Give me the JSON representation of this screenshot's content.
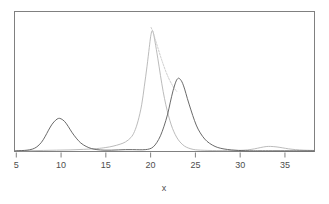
{
  "chart_data": {
    "type": "line",
    "title": "",
    "subtitle": "",
    "xlabel": "x",
    "ylabel": "",
    "xlim": [
      4.8,
      38.3
    ],
    "ylim": [
      0,
      1.05
    ],
    "grid": false,
    "legend": "none",
    "xticks": [
      5,
      10,
      15,
      20,
      25,
      30,
      35
    ],
    "xticklabels": [
      "5",
      "10",
      "15",
      "20",
      "25",
      "30",
      "35"
    ],
    "yticks": [],
    "yticklabels": [],
    "axis_box": "full-rectangle",
    "colors": {
      "dark_curve": "#595959",
      "light_curve": "#b3b3b3",
      "axis": "#808080",
      "text": "#4d4d4d",
      "background": "#ffffff"
    },
    "series": [
      {
        "name": "dark-density",
        "color": "#595959",
        "linewidth": 0.9,
        "style": "solid",
        "points": [
          [
            4.9,
            0.005
          ],
          [
            5.6,
            0.007
          ],
          [
            6.2,
            0.01
          ],
          [
            6.8,
            0.018
          ],
          [
            7.3,
            0.035
          ],
          [
            7.8,
            0.068
          ],
          [
            8.2,
            0.11
          ],
          [
            8.6,
            0.16
          ],
          [
            9.0,
            0.205
          ],
          [
            9.4,
            0.235
          ],
          [
            9.7,
            0.248
          ],
          [
            10.0,
            0.245
          ],
          [
            10.4,
            0.225
          ],
          [
            10.8,
            0.188
          ],
          [
            11.2,
            0.145
          ],
          [
            11.7,
            0.1
          ],
          [
            12.2,
            0.064
          ],
          [
            12.8,
            0.038
          ],
          [
            13.4,
            0.022
          ],
          [
            14.0,
            0.014
          ],
          [
            14.8,
            0.01
          ],
          [
            15.6,
            0.01
          ],
          [
            16.4,
            0.012
          ],
          [
            17.2,
            0.014
          ],
          [
            18.0,
            0.014
          ],
          [
            18.8,
            0.013
          ],
          [
            19.4,
            0.014
          ],
          [
            19.9,
            0.02
          ],
          [
            20.3,
            0.035
          ],
          [
            20.7,
            0.068
          ],
          [
            21.1,
            0.118
          ],
          [
            21.5,
            0.19
          ],
          [
            21.9,
            0.28
          ],
          [
            22.2,
            0.37
          ],
          [
            22.5,
            0.455
          ],
          [
            22.8,
            0.52
          ],
          [
            23.0,
            0.545
          ],
          [
            23.2,
            0.548
          ],
          [
            23.5,
            0.522
          ],
          [
            23.8,
            0.468
          ],
          [
            24.1,
            0.398
          ],
          [
            24.5,
            0.312
          ],
          [
            24.9,
            0.232
          ],
          [
            25.3,
            0.168
          ],
          [
            25.8,
            0.114
          ],
          [
            26.3,
            0.076
          ],
          [
            26.9,
            0.048
          ],
          [
            27.5,
            0.03
          ],
          [
            28.2,
            0.019
          ],
          [
            29.0,
            0.012
          ],
          [
            29.8,
            0.008
          ],
          [
            30.6,
            0.006
          ],
          [
            31.5,
            0.005
          ],
          [
            32.5,
            0.005
          ],
          [
            34.0,
            0.005
          ],
          [
            36.0,
            0.005
          ],
          [
            38.2,
            0.005
          ]
        ]
      },
      {
        "name": "light-density-main",
        "color": "#b3b3b3",
        "linewidth": 0.9,
        "style": "solid",
        "points": [
          [
            5.0,
            0.005
          ],
          [
            6.5,
            0.006
          ],
          [
            8.0,
            0.008
          ],
          [
            9.5,
            0.01
          ],
          [
            11.0,
            0.012
          ],
          [
            12.5,
            0.016
          ],
          [
            14.0,
            0.022
          ],
          [
            15.0,
            0.03
          ],
          [
            15.8,
            0.04
          ],
          [
            16.6,
            0.055
          ],
          [
            17.2,
            0.072
          ],
          [
            17.8,
            0.105
          ],
          [
            18.2,
            0.15
          ],
          [
            18.6,
            0.23
          ],
          [
            19.0,
            0.35
          ],
          [
            19.3,
            0.49
          ],
          [
            19.6,
            0.64
          ],
          [
            19.85,
            0.78
          ],
          [
            20.0,
            0.86
          ],
          [
            20.15,
            0.905
          ],
          [
            20.3,
            0.89
          ],
          [
            20.5,
            0.82
          ],
          [
            20.8,
            0.7
          ],
          [
            21.1,
            0.57
          ],
          [
            21.4,
            0.45
          ],
          [
            21.7,
            0.35
          ],
          [
            22.0,
            0.268
          ],
          [
            22.3,
            0.2
          ],
          [
            22.6,
            0.148
          ],
          [
            22.9,
            0.108
          ],
          [
            23.2,
            0.078
          ],
          [
            23.6,
            0.05
          ],
          [
            24.0,
            0.032
          ],
          [
            24.5,
            0.02
          ],
          [
            25.0,
            0.013
          ],
          [
            25.6,
            0.01
          ],
          [
            26.4,
            0.008
          ],
          [
            27.4,
            0.007
          ],
          [
            28.6,
            0.007
          ],
          [
            29.8,
            0.008
          ],
          [
            30.8,
            0.012
          ],
          [
            31.6,
            0.02
          ],
          [
            32.3,
            0.03
          ],
          [
            32.9,
            0.037
          ],
          [
            33.4,
            0.038
          ],
          [
            34.0,
            0.035
          ],
          [
            34.7,
            0.028
          ],
          [
            35.4,
            0.02
          ],
          [
            36.2,
            0.014
          ],
          [
            37.1,
            0.01
          ],
          [
            38.2,
            0.008
          ]
        ]
      },
      {
        "name": "light-density-shoulder",
        "color": "#c4c4c4",
        "linewidth": 0.9,
        "style": "dotted",
        "points": [
          [
            20.05,
            0.93
          ],
          [
            20.25,
            0.9
          ],
          [
            20.5,
            0.845
          ],
          [
            20.8,
            0.78
          ],
          [
            21.1,
            0.715
          ],
          [
            21.4,
            0.655
          ],
          [
            21.7,
            0.6
          ],
          [
            22.0,
            0.552
          ],
          [
            22.3,
            0.512
          ],
          [
            22.6,
            0.478
          ],
          [
            22.9,
            0.452
          ]
        ]
      }
    ],
    "annotations": []
  },
  "axis": {
    "x_title": "x",
    "tick_labels": [
      "5",
      "10",
      "15",
      "20",
      "25",
      "30",
      "35"
    ]
  }
}
